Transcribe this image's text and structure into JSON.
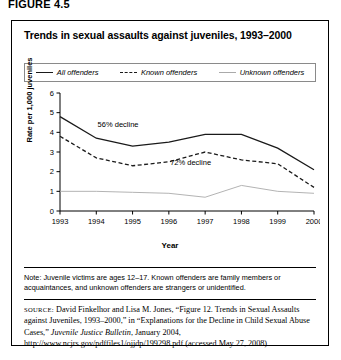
{
  "figure_label": "FIGURE 4.5",
  "panel": {
    "title": "Trends in sexual assaults against juveniles, 1993–2000"
  },
  "legend": {
    "items": [
      {
        "label": "All offenders",
        "style": "solid",
        "color": "#1a1a1a"
      },
      {
        "label": "Known offenders",
        "style": "dashed",
        "color": "#1a1a1a"
      },
      {
        "label": "Unknown offenders",
        "style": "light",
        "color": "#aaaaaa"
      }
    ]
  },
  "note": {
    "text": "Note: Juvenile victims are ages 12–17. Known offenders are family members or acquaintances, and unknown offenders are strangers or unidentified."
  },
  "source": {
    "label": "SOURCE:",
    "body_1": " David Finkelhor and Lisa M. Jones, “Figure 12. Trends in Sexual Assaults against Juveniles, 1993–2000,” in “Explanations for the Decline in Child Sexual Abuse Cases,” ",
    "italic_1": "Juvenile Justice Bulletin",
    "body_2": ", January 2004, http://www.ncjrs.gov/pdffiles1/ojjdp/199298.pdf (accessed May 27, 2008)"
  },
  "chart_data": {
    "type": "line",
    "title": "Trends in sexual assaults against juveniles, 1993–2000",
    "xlabel": "Year",
    "ylabel": "Rate per 1,000 juveniles",
    "categories": [
      "1993",
      "1994",
      "1995",
      "1996",
      "1997",
      "1998",
      "1999",
      "2000"
    ],
    "x": [
      1993,
      1994,
      1995,
      1996,
      1997,
      1998,
      1999,
      2000
    ],
    "xlim": [
      1993,
      2000
    ],
    "ylim": [
      0,
      6
    ],
    "yticks": [
      0,
      1,
      2,
      3,
      4,
      5,
      6
    ],
    "xticks": [
      1993,
      1994,
      1995,
      1996,
      1997,
      1998,
      1999,
      2000
    ],
    "grid": false,
    "legend_position": "top",
    "series": [
      {
        "name": "All offenders",
        "style": "solid",
        "color": "#1a1a1a",
        "values": [
          4.8,
          3.7,
          3.3,
          3.5,
          3.9,
          3.9,
          3.2,
          2.1
        ]
      },
      {
        "name": "Known offenders",
        "style": "dashed",
        "color": "#1a1a1a",
        "values": [
          3.8,
          2.7,
          2.3,
          2.5,
          3.0,
          2.6,
          2.4,
          1.2
        ]
      },
      {
        "name": "Unknown offenders",
        "style": "solid-light",
        "color": "#aaaaaa",
        "values": [
          1.0,
          1.0,
          0.95,
          0.9,
          0.7,
          1.3,
          1.0,
          0.9
        ]
      }
    ],
    "annotations": [
      {
        "text": "56% decline",
        "x": 1994.6,
        "y": 4.25
      },
      {
        "text": "72% decline",
        "x": 1996.6,
        "y": 2.35
      }
    ]
  }
}
